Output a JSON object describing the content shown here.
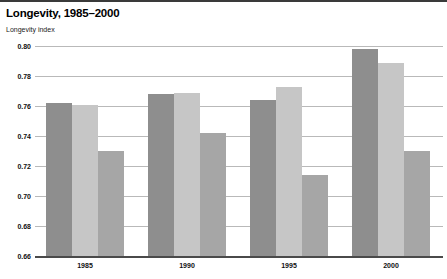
{
  "header": {
    "title": "Longevity, 1985–2000",
    "axis_caption": "Longevity index"
  },
  "chart_data": {
    "type": "bar",
    "title": "Longevity, 1985–2000",
    "xlabel": "",
    "ylabel": "Longevity index",
    "ylim": [
      0.66,
      0.8
    ],
    "ytick_step": 0.02,
    "ytick_labels": [
      "0.80",
      "0.78",
      "0.76",
      "0.74",
      "0.72",
      "0.70",
      "0.68",
      "0.66"
    ],
    "ytick_values": [
      0.8,
      0.78,
      0.76,
      0.74,
      0.72,
      0.7,
      0.68,
      0.66
    ],
    "grid": true,
    "legend": "none",
    "categories": [
      "1985",
      "1990",
      "1995",
      "2000"
    ],
    "series": [
      {
        "name": "series-1",
        "color": "#8e8e8e",
        "values": [
          0.762,
          0.768,
          0.764,
          0.798
        ]
      },
      {
        "name": "series-2",
        "color": "#c6c6c6",
        "values": [
          0.761,
          0.769,
          0.773,
          0.789
        ]
      },
      {
        "name": "series-3",
        "color": "#a6a6a6",
        "values": [
          0.73,
          0.742,
          0.714,
          0.73
        ]
      }
    ]
  },
  "colors": {
    "series_1": "#8e8e8e",
    "series_2": "#c6c6c6",
    "series_3": "#a6a6a6",
    "gridline": "#b9b9b9",
    "baseline": "#4a4a4a",
    "top_rule": "#3a3a3a",
    "text": "#000000"
  }
}
